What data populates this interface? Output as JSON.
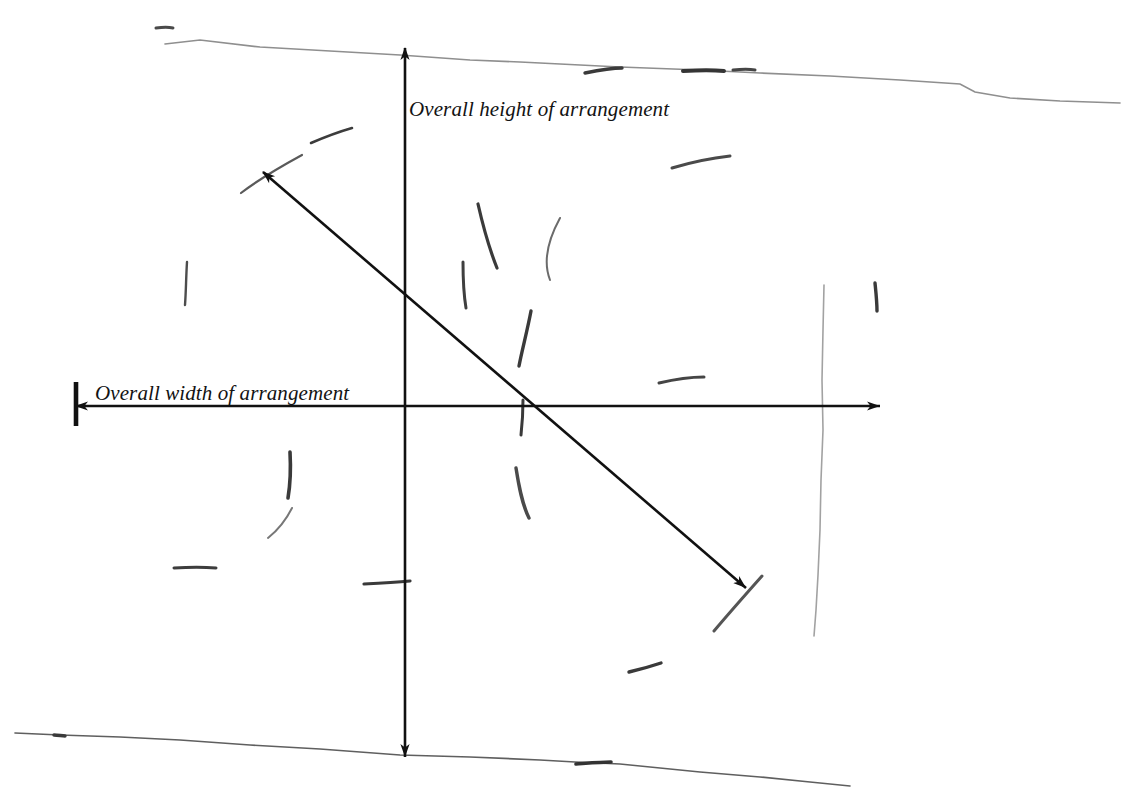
{
  "figure": {
    "kind": "hand-drawn-diagram",
    "background_color": "#ffffff",
    "ink_color": "#111111",
    "pencil_color": "#6e6e6e",
    "pencil_color_light": "#9a9a9a",
    "labels": {
      "height": "Overall height of arrangement",
      "width": "Overall width of arrangement"
    },
    "axes": {
      "origin": {
        "x": 405,
        "y": 406
      },
      "vertical": {
        "name": "overall-height-dimension-arrow",
        "x": 405,
        "y_top": 48,
        "y_bottom": 757,
        "arrowheads": "both-ends",
        "length_px": 709
      },
      "horizontal": {
        "name": "overall-width-dimension-arrow",
        "y": 406,
        "x_left": 76,
        "x_right": 880,
        "arrowheads": "both-ends",
        "left_terminator": "tick-bar",
        "length_px": 804
      },
      "diagonal": {
        "name": "longest-extent-dimension-arrow",
        "x1": 263,
        "y1": 172,
        "x2": 746,
        "y2": 588,
        "arrowheads": "both-ends"
      }
    },
    "horizon_lines": [
      {
        "name": "upper-horizon-line",
        "points": "165,44 200,40 260,47 330,51 400,55 470,60 520,62 560,64 620,67 700,70 760,73 830,76 900,80 960,84 975,92 1010,98 1060,101 1120,103"
      },
      {
        "name": "lower-horizon-line",
        "points": "15,733 60,735 120,737 180,740 250,745 320,749 400,755 470,757 540,760 575,762 620,764 700,772 760,777 810,782 850,786"
      }
    ],
    "vertical_pencil_line": {
      "name": "right-vertical-pencil-line",
      "points": "824,285 823,330 822,380 823,430 821,480 820,530 818,575 816,610 814,636"
    },
    "strokes": [
      {
        "name": "needle-stroke",
        "d": "M 241,193 C 258,180 280,167 302,155",
        "w": 2.2,
        "c": "#5a5a5a"
      },
      {
        "name": "needle-stroke",
        "d": "M 311,143 C 325,137 338,132 352,128",
        "w": 2.6,
        "c": "#3c3c3c"
      },
      {
        "name": "needle-stroke",
        "d": "M 672,168 C 692,162 712,158 730,156",
        "w": 3.0,
        "c": "#4a4a4a"
      },
      {
        "name": "needle-stroke",
        "d": "M 187,262 C 186,278 186,292 185,305",
        "w": 2.4,
        "c": "#4d4d4d"
      },
      {
        "name": "needle-stroke",
        "d": "M 478,204 C 483,226 489,248 497,268",
        "w": 3.2,
        "c": "#3a3a3a"
      },
      {
        "name": "needle-stroke",
        "d": "M 560,218 C 548,240 543,262 550,280",
        "w": 2.0,
        "c": "#6b6b6b"
      },
      {
        "name": "needle-stroke",
        "d": "M 463,262 C 463,280 464,296 466,308",
        "w": 3.0,
        "c": "#3f3f3f"
      },
      {
        "name": "needle-stroke",
        "d": "M 531,311 C 527,332 522,350 519,366",
        "w": 3.4,
        "c": "#3a3a3a"
      },
      {
        "name": "needle-stroke",
        "d": "M 659,383 C 676,379 692,377 704,377",
        "w": 3.0,
        "c": "#454545"
      },
      {
        "name": "needle-stroke",
        "d": "M 523,400 C 523,414 522,426 521,435",
        "w": 3.0,
        "c": "#3a3a3a"
      },
      {
        "name": "needle-stroke",
        "d": "M 875,283 C 876,293 877,302 877,311",
        "w": 3.4,
        "c": "#3a3a3a"
      },
      {
        "name": "needle-stroke",
        "d": "M 290,452 C 291,470 290,486 288,498",
        "w": 3.6,
        "c": "#3a3a3a"
      },
      {
        "name": "needle-stroke",
        "d": "M 292,508 C 286,520 278,530 268,538",
        "w": 2.0,
        "c": "#777777"
      },
      {
        "name": "needle-stroke",
        "d": "M 516,468 C 519,487 522,504 529,518",
        "w": 3.4,
        "c": "#4a4a4a"
      },
      {
        "name": "needle-stroke",
        "d": "M 174,568 C 190,567 204,567 216,568",
        "w": 3.0,
        "c": "#3d3d3d"
      },
      {
        "name": "needle-stroke",
        "d": "M 364,584 C 382,583 398,582 410,581",
        "w": 3.2,
        "c": "#3a3a3a"
      },
      {
        "name": "needle-stroke",
        "d": "M 714,631 C 730,612 746,594 762,576",
        "w": 3.0,
        "c": "#555555"
      },
      {
        "name": "needle-stroke",
        "d": "M 629,672 C 642,669 652,666 661,663",
        "w": 3.4,
        "c": "#3a3a3a"
      },
      {
        "name": "needle-stroke",
        "d": "M 156,28 C 163,27 169,27 173,28",
        "w": 3.0,
        "c": "#4a4a4a"
      },
      {
        "name": "needle-stroke",
        "d": "M 585,73 C 600,70 613,68 622,68",
        "w": 3.4,
        "c": "#3a3a3a"
      },
      {
        "name": "needle-stroke",
        "d": "M 683,71 C 700,70 714,70 724,71",
        "w": 4.0,
        "c": "#353535"
      },
      {
        "name": "needle-stroke",
        "d": "M 733,70 C 742,69 750,69 755,70",
        "w": 3.0,
        "c": "#454545"
      },
      {
        "name": "needle-stroke",
        "d": "M 54,735 C 58,735 62,736 65,736",
        "w": 3.4,
        "c": "#3a3a3a"
      },
      {
        "name": "needle-stroke",
        "d": "M 576,764 C 590,763 602,762 611,762",
        "w": 3.6,
        "c": "#333333"
      }
    ]
  }
}
